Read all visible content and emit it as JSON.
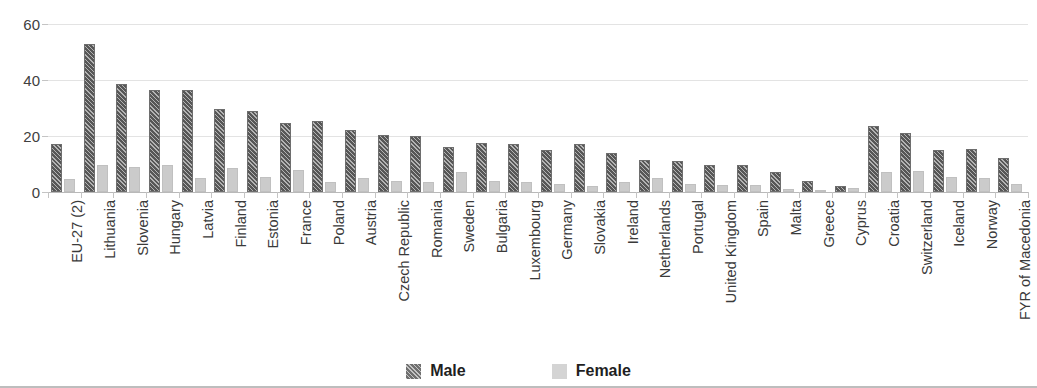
{
  "title_sliver": "",
  "legend": {
    "position": "bottom",
    "items": [
      {
        "label": "Male",
        "swatch": "male-hatched-dark-gray",
        "color": "#575757"
      },
      {
        "label": "Female",
        "swatch": "female-solid-light-gray",
        "color": "#cbcbcb"
      }
    ]
  },
  "axis": {
    "y_ticks": [
      "0",
      "20",
      "40",
      "60"
    ],
    "y_min": 0,
    "y_max": 60
  },
  "chart_data": {
    "type": "bar",
    "title": "",
    "xlabel": "",
    "ylabel": "",
    "ylim": [
      0,
      60
    ],
    "yticks": [
      0,
      20,
      40,
      60
    ],
    "grid": "horizontal",
    "legend_position": "bottom",
    "categories": [
      "EU-27 (2)",
      "Lithuania",
      "Slovenia",
      "Hungary",
      "Latvia",
      "Finland",
      "Estonia",
      "France",
      "Poland",
      "Austria",
      "Czech Republic",
      "Romania",
      "Sweden",
      "Bulgaria",
      "Luxembourg",
      "Germany",
      "Slovakia",
      "Ireland",
      "Netherlands",
      "Portugal",
      "United Kingdom",
      "Spain",
      "Malta",
      "Greece",
      "Cyprus",
      "Croatia",
      "Switzerland",
      "Iceland",
      "Norway",
      "FYR of Macedonia"
    ],
    "series": [
      {
        "name": "Male",
        "color": "#575757",
        "values": [
          17.0,
          53.0,
          38.5,
          36.5,
          36.5,
          29.5,
          29.0,
          24.5,
          25.5,
          22.0,
          20.5,
          20.0,
          16.0,
          17.5,
          17.0,
          15.0,
          17.0,
          14.0,
          11.5,
          11.0,
          9.5,
          9.5,
          7.0,
          4.0,
          2.0,
          23.5,
          21.0,
          15.0,
          15.5,
          12.0
        ]
      },
      {
        "name": "Female",
        "color": "#cbcbcb",
        "values": [
          4.5,
          9.5,
          9.0,
          9.5,
          5.0,
          8.5,
          5.5,
          8.0,
          3.5,
          5.0,
          4.0,
          3.5,
          7.0,
          4.0,
          3.5,
          3.0,
          2.0,
          3.5,
          5.0,
          3.0,
          2.5,
          2.5,
          1.0,
          0.5,
          1.5,
          7.0,
          7.5,
          5.5,
          5.0,
          3.0
        ]
      }
    ]
  }
}
